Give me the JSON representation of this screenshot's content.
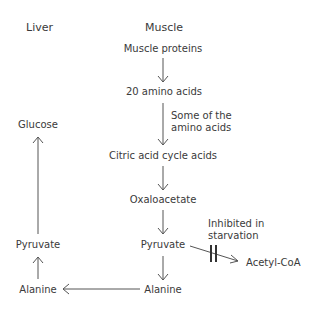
{
  "headers": {
    "liver": "Liver",
    "muscle": "Muscle"
  },
  "muscle_column": {
    "muscle_proteins": "Muscle proteins",
    "amino_acids_20": "20 amino acids",
    "some_amino_acids_line1": "Some of the",
    "some_amino_acids_line2": "amino acids",
    "citric_acid_cycle_acids": "Citric acid cycle acids",
    "oxaloacetate": "Oxaloacetate",
    "pyruvate": "Pyruvate",
    "alanine": "Alanine",
    "acetyl_coa": "Acetyl-CoA",
    "inhibited_line1": "Inhibited in",
    "inhibited_line2": "starvation"
  },
  "liver_column": {
    "glucose": "Glucose",
    "pyruvate": "Pyruvate",
    "alanine": "Alanine"
  },
  "colors": {
    "text": "#3a3a3a",
    "arrow": "#555555",
    "background": "#ffffff"
  }
}
